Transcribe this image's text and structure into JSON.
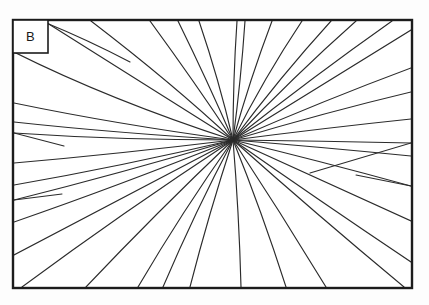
{
  "figure": {
    "panel_label": "B",
    "caption": "",
    "background_color": "#fdfdfd",
    "plot_background_color": "#ffffff",
    "line_color": "#2b2b2b",
    "frame_color": "#1c1c1c"
  },
  "label_box": {
    "text": "B",
    "x": 13,
    "y": 20,
    "width": 35,
    "height": 33,
    "border_color": "#1c1c1c",
    "fill": "#ffffff"
  },
  "frame": {
    "x": 13,
    "y": 20,
    "width": 399,
    "height": 268,
    "stroke_width": 2.4,
    "color": "#1c1c1c"
  },
  "chart_data": {
    "type": "diagram",
    "subtype": "radial-line-convergence",
    "title": "",
    "xlabel": "",
    "ylabel": "",
    "grid": false,
    "legend": null,
    "axis_ranges": {
      "x": [
        13,
        412
      ],
      "y": [
        20,
        288
      ]
    },
    "convergence_point": {
      "x": 233,
      "y": 140
    },
    "line_count": 34,
    "lines": [
      {
        "id": "r01",
        "from": [
          233,
          140
        ],
        "to": [
          44,
          21
        ],
        "bend": [
          150,
          88
        ]
      },
      {
        "id": "r02",
        "from": [
          233,
          140
        ],
        "to": [
          91,
          21
        ],
        "bend": [
          172,
          83
        ]
      },
      {
        "id": "r03",
        "from": [
          130,
          62
        ],
        "to": [
          44,
          22
        ],
        "bend": [
          88,
          40
        ]
      },
      {
        "id": "r04",
        "from": [
          233,
          140
        ],
        "to": [
          150,
          21
        ],
        "bend": [
          196,
          84
        ]
      },
      {
        "id": "r05",
        "from": [
          233,
          140
        ],
        "to": [
          178,
          21
        ],
        "bend": [
          208,
          82
        ]
      },
      {
        "id": "r06",
        "from": [
          233,
          140
        ],
        "to": [
          199,
          21
        ],
        "bend": [
          219,
          80
        ]
      },
      {
        "id": "r07",
        "from": [
          233,
          140
        ],
        "to": [
          237,
          21
        ],
        "bend": [
          233,
          80
        ]
      },
      {
        "id": "r08",
        "from": [
          233,
          140
        ],
        "to": [
          245,
          21
        ],
        "bend": [
          241,
          80
        ]
      },
      {
        "id": "r09",
        "from": [
          233,
          140
        ],
        "to": [
          272,
          21
        ],
        "bend": [
          250,
          79
        ]
      },
      {
        "id": "r10",
        "from": [
          233,
          140
        ],
        "to": [
          302,
          21
        ],
        "bend": [
          264,
          78
        ]
      },
      {
        "id": "r11",
        "from": [
          233,
          140
        ],
        "to": [
          331,
          21
        ],
        "bend": [
          280,
          77
        ]
      },
      {
        "id": "r12",
        "from": [
          233,
          140
        ],
        "to": [
          356,
          21
        ],
        "bend": [
          294,
          76
        ]
      },
      {
        "id": "r13",
        "from": [
          233,
          140
        ],
        "to": [
          392,
          21
        ],
        "bend": [
          314,
          76
        ]
      },
      {
        "id": "r14",
        "from": [
          233,
          140
        ],
        "to": [
          411,
          30
        ],
        "bend": [
          327,
          82
        ]
      },
      {
        "id": "r15",
        "from": [
          233,
          140
        ],
        "to": [
          411,
          68
        ],
        "bend": [
          325,
          100
        ]
      },
      {
        "id": "r16",
        "from": [
          233,
          140
        ],
        "to": [
          411,
          92
        ],
        "bend": [
          327,
          112
        ]
      },
      {
        "id": "r17",
        "from": [
          233,
          140
        ],
        "to": [
          411,
          119
        ],
        "bend": [
          325,
          128
        ]
      },
      {
        "id": "r18",
        "from": [
          233,
          140
        ],
        "to": [
          411,
          143
        ],
        "bend": [
          322,
          141
        ]
      },
      {
        "id": "r19",
        "from": [
          233,
          140
        ],
        "to": [
          411,
          156
        ],
        "bend": [
          320,
          147
        ]
      },
      {
        "id": "r20",
        "from": [
          233,
          140
        ],
        "to": [
          411,
          186
        ],
        "bend": [
          320,
          161
        ]
      },
      {
        "id": "r21",
        "from": [
          233,
          140
        ],
        "to": [
          411,
          221
        ],
        "bend": [
          318,
          179
        ]
      },
      {
        "id": "r22",
        "from": [
          233,
          140
        ],
        "to": [
          411,
          262
        ],
        "bend": [
          317,
          199
        ]
      },
      {
        "id": "r23",
        "from": [
          233,
          140
        ],
        "to": [
          404,
          287
        ],
        "bend": [
          315,
          213
        ]
      },
      {
        "id": "r24",
        "from": [
          233,
          140
        ],
        "to": [
          326,
          287
        ],
        "bend": [
          281,
          213
        ]
      },
      {
        "id": "r25",
        "from": [
          233,
          140
        ],
        "to": [
          286,
          287
        ],
        "bend": [
          262,
          212
        ]
      },
      {
        "id": "r26",
        "from": [
          233,
          140
        ],
        "to": [
          241,
          287
        ],
        "bend": [
          239,
          212
        ]
      },
      {
        "id": "r27",
        "from": [
          233,
          140
        ],
        "to": [
          190,
          287
        ],
        "bend": [
          209,
          213
        ]
      },
      {
        "id": "r28",
        "from": [
          233,
          140
        ],
        "to": [
          163,
          287
        ],
        "bend": [
          195,
          212
        ]
      },
      {
        "id": "r29",
        "from": [
          233,
          140
        ],
        "to": [
          138,
          287
        ],
        "bend": [
          182,
          212
        ]
      },
      {
        "id": "r30",
        "from": [
          233,
          140
        ],
        "to": [
          86,
          287
        ],
        "bend": [
          156,
          213
        ]
      },
      {
        "id": "r31",
        "from": [
          233,
          140
        ],
        "to": [
          22,
          287
        ],
        "bend": [
          122,
          213
        ]
      },
      {
        "id": "r32",
        "from": [
          233,
          140
        ],
        "to": [
          14,
          255
        ],
        "bend": [
          118,
          200
        ]
      },
      {
        "id": "r33",
        "from": [
          233,
          140
        ],
        "to": [
          14,
          222
        ],
        "bend": [
          118,
          186
        ]
      },
      {
        "id": "r34",
        "from": [
          233,
          140
        ],
        "to": [
          14,
          200
        ],
        "bend": [
          118,
          174
        ]
      },
      {
        "id": "r35",
        "from": [
          233,
          140
        ],
        "to": [
          14,
          185
        ],
        "bend": [
          118,
          167
        ]
      },
      {
        "id": "r36",
        "from": [
          233,
          140
        ],
        "to": [
          14,
          163
        ],
        "bend": [
          118,
          154
        ]
      },
      {
        "id": "r37",
        "from": [
          233,
          140
        ],
        "to": [
          14,
          133
        ],
        "bend": [
          118,
          140
        ]
      },
      {
        "id": "r38",
        "from": [
          233,
          140
        ],
        "to": [
          14,
          122
        ],
        "bend": [
          115,
          133
        ]
      },
      {
        "id": "r39",
        "from": [
          233,
          140
        ],
        "to": [
          14,
          103
        ],
        "bend": [
          115,
          124
        ]
      },
      {
        "id": "r40",
        "from": [
          233,
          140
        ],
        "to": [
          14,
          52
        ],
        "bend": [
          110,
          100
        ]
      }
    ],
    "branch_junctions": [
      {
        "id": "j1",
        "at": [
          130,
          62
        ],
        "note": "fork near upper-left"
      },
      {
        "id": "j2",
        "at": [
          64,
          146
        ],
        "note": "Y junction on left-middle"
      },
      {
        "id": "j3",
        "at": [
          62,
          194
        ],
        "note": "Y junction lower-left"
      },
      {
        "id": "j4",
        "at": [
          310,
          173
        ],
        "note": "fork on right side"
      },
      {
        "id": "j5",
        "at": [
          356,
          175
        ],
        "note": "fork near right edge"
      }
    ],
    "branch_segments": [
      {
        "id": "b1",
        "from": [
          64,
          146
        ],
        "to": [
          14,
          133
        ]
      },
      {
        "id": "b2",
        "from": [
          62,
          194
        ],
        "to": [
          14,
          200
        ]
      },
      {
        "id": "b3",
        "from": [
          310,
          173
        ],
        "to": [
          411,
          143
        ]
      },
      {
        "id": "b4",
        "from": [
          356,
          175
        ],
        "to": [
          411,
          186
        ]
      }
    ]
  }
}
